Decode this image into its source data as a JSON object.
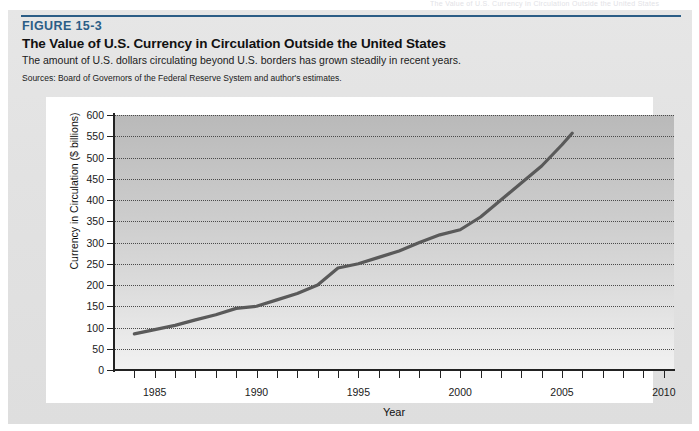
{
  "running_header": "The Value of U.S. Currency in Circulation Outside the United States",
  "figure": {
    "label": "FIGURE 15-3",
    "title": "The Value of U.S. Currency in Circulation Outside the United States",
    "subtitle": "The amount of U.S. dollars circulating beyond U.S. borders has grown steadily in recent years.",
    "source": "Sources: Board of Governors of the Federal Reserve System and author's estimates.",
    "accent_color": "#2b5d86"
  },
  "chart_data": {
    "type": "line",
    "title": "The Value of U.S. Currency in Circulation Outside the United States",
    "xlabel": "Year",
    "ylabel": "Currency in Circulation ($ billions)",
    "xlim": [
      1983,
      2010.5
    ],
    "ylim": [
      0,
      600
    ],
    "ytick_labels": [
      "0",
      "50",
      "100",
      "150",
      "200",
      "250",
      "300",
      "350",
      "400",
      "450",
      "500",
      "550",
      "600"
    ],
    "ytick_values": [
      0,
      50,
      100,
      150,
      200,
      250,
      300,
      350,
      400,
      450,
      500,
      550,
      600
    ],
    "xtick_labels": [
      "1985",
      "1990",
      "1995",
      "2000",
      "2005",
      "2010"
    ],
    "xtick_values": [
      1985,
      1990,
      1995,
      2000,
      2005,
      2010
    ],
    "x_minor_tick_step": 1,
    "grid": "horizontal-dotted",
    "legend": "none",
    "line_color": "#5a5a5a",
    "series": [
      {
        "name": "Currency in circulation outside the U.S.",
        "x": [
          1984,
          1985,
          1986,
          1987,
          1988,
          1989,
          1990,
          1991,
          1992,
          1993,
          1994,
          1995,
          1996,
          1997,
          1998,
          1999,
          2000,
          2001,
          2002,
          2003,
          2004,
          2005,
          2005.5
        ],
        "values": [
          85,
          95,
          105,
          118,
          130,
          145,
          150,
          165,
          180,
          200,
          240,
          250,
          265,
          280,
          300,
          318,
          330,
          360,
          400,
          440,
          480,
          530,
          557
        ]
      }
    ]
  }
}
